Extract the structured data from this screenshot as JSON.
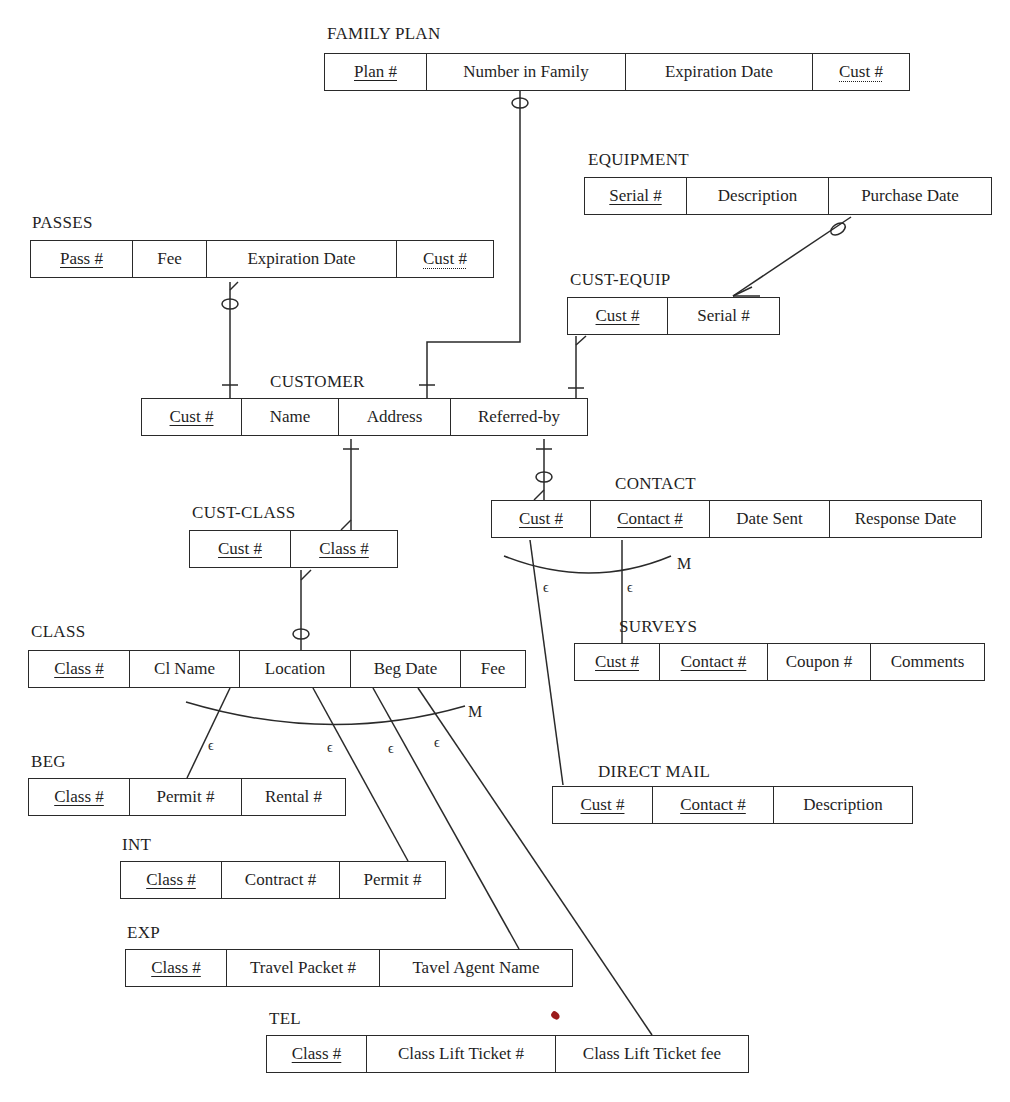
{
  "diagram_type": "entity-relationship",
  "entities": {
    "family_plan": {
      "title": "FAMILY PLAN",
      "attrs": [
        "Plan #",
        "Number in Family",
        "Expiration Date",
        "Cust #"
      ],
      "keys": [
        "pk",
        "",
        "",
        "fk"
      ]
    },
    "equipment": {
      "title": "EQUIPMENT",
      "attrs": [
        "Serial #",
        "Description",
        "Purchase Date"
      ],
      "keys": [
        "pk",
        "",
        ""
      ]
    },
    "passes": {
      "title": "PASSES",
      "attrs": [
        "Pass #",
        "Fee",
        "Expiration Date",
        "Cust #"
      ],
      "keys": [
        "pk",
        "",
        "",
        "fk"
      ]
    },
    "cust_equip": {
      "title": "CUST-EQUIP",
      "attrs": [
        "Cust #",
        "Serial #"
      ],
      "keys": [
        "pk",
        ""
      ]
    },
    "customer": {
      "title": "CUSTOMER",
      "attrs": [
        "Cust #",
        "Name",
        "Address",
        "Referred-by"
      ],
      "keys": [
        "pk",
        "",
        "",
        ""
      ]
    },
    "cust_class": {
      "title": "CUST-CLASS",
      "attrs": [
        "Cust #",
        "Class #"
      ],
      "keys": [
        "pk",
        "pk"
      ]
    },
    "contact": {
      "title": "CONTACT",
      "attrs": [
        "Cust #",
        "Contact #",
        "Date Sent",
        "Response Date"
      ],
      "keys": [
        "pk",
        "pk",
        "",
        ""
      ]
    },
    "surveys": {
      "title": "SURVEYS",
      "attrs": [
        "Cust #",
        "Contact #",
        "Coupon #",
        "Comments"
      ],
      "keys": [
        "pk",
        "pk",
        "",
        ""
      ]
    },
    "class": {
      "title": "CLASS",
      "attrs": [
        "Class #",
        "Cl Name",
        "Location",
        "Beg Date",
        "Fee"
      ],
      "keys": [
        "pk",
        "",
        "",
        "",
        ""
      ]
    },
    "beg": {
      "title": "BEG",
      "attrs": [
        "Class #",
        "Permit #",
        "Rental #"
      ],
      "keys": [
        "pk",
        "",
        ""
      ]
    },
    "direct_mail": {
      "title": "DIRECT MAIL",
      "attrs": [
        "Cust #",
        "Contact #",
        "Description"
      ],
      "keys": [
        "pk",
        "pk",
        ""
      ]
    },
    "int": {
      "title": "INT",
      "attrs": [
        "Class #",
        "Contract #",
        "Permit #"
      ],
      "keys": [
        "pk",
        "",
        ""
      ]
    },
    "exp": {
      "title": "EXP",
      "attrs": [
        "Class #",
        "Travel Packet #",
        "Tavel Agent Name"
      ],
      "keys": [
        "pk",
        "",
        ""
      ]
    },
    "tel": {
      "title": "TEL",
      "attrs": [
        "Class #",
        "Class Lift Ticket #",
        "Class Lift Ticket fee"
      ],
      "keys": [
        "pk",
        "",
        ""
      ]
    }
  },
  "subtype_markers": {
    "contact_m": "M",
    "class_m": "M",
    "epsilon": "ϵ"
  },
  "relationships": [
    {
      "from": "FAMILY PLAN",
      "to": "CUSTOMER",
      "from_end": "zero-or-one",
      "to_end": "one"
    },
    {
      "from": "PASSES",
      "to": "CUSTOMER",
      "from_end": "zero-or-many",
      "to_end": "one"
    },
    {
      "from": "EQUIPMENT",
      "to": "CUST-EQUIP",
      "from_end": "zero-or-one",
      "to_end": "many"
    },
    {
      "from": "CUST-EQUIP",
      "to": "CUSTOMER",
      "from_end": "many",
      "to_end": "one"
    },
    {
      "from": "CUSTOMER",
      "to": "CUST-CLASS",
      "from_end": "one",
      "to_end": "many"
    },
    {
      "from": "CUST-CLASS",
      "to": "CLASS",
      "from_end": "many",
      "to_end": "zero-or-one"
    },
    {
      "from": "CUSTOMER",
      "to": "CONTACT",
      "from_end": "one",
      "to_end": "zero-or-many"
    },
    {
      "from": "CONTACT",
      "to": [
        "SURVEYS",
        "DIRECT MAIL"
      ],
      "type": "subtype",
      "marker": "M"
    },
    {
      "from": "CLASS",
      "to": [
        "BEG",
        "INT",
        "EXP",
        "TEL"
      ],
      "type": "subtype",
      "marker": "M"
    }
  ]
}
